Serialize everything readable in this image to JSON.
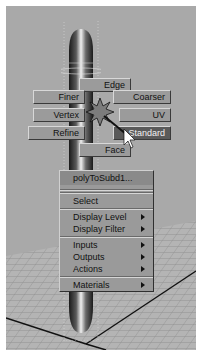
{
  "viewport": {
    "background": "#a9a9a9",
    "object": "cylinder-selected"
  },
  "marking_menu": {
    "center_icon": "star-cursor-icon",
    "items": [
      {
        "label": "Edge",
        "position": "N"
      },
      {
        "label": "Finer",
        "position": "NW"
      },
      {
        "label": "Coarser",
        "position": "NE"
      },
      {
        "label": "Vertex",
        "position": "W"
      },
      {
        "label": "UV",
        "position": "E"
      },
      {
        "label": "Refine",
        "position": "SW"
      },
      {
        "label": "Standard",
        "position": "SE",
        "highlighted": true
      },
      {
        "label": "Face",
        "position": "S"
      }
    ]
  },
  "context_menu": {
    "title": "polyToSubd1...",
    "items": [
      {
        "label": "Select",
        "submenu": false
      },
      {
        "label": "Display Level",
        "submenu": true
      },
      {
        "label": "Display Filter",
        "submenu": true
      },
      {
        "label": "Inputs",
        "submenu": true
      },
      {
        "label": "Outputs",
        "submenu": true
      },
      {
        "label": "Actions",
        "submenu": true
      },
      {
        "label": "Materials",
        "submenu": true
      }
    ]
  },
  "colors": {
    "button": "#9b9b9b",
    "highlight": "#5a5a5a",
    "menu_bg": "#9a9a9a"
  }
}
